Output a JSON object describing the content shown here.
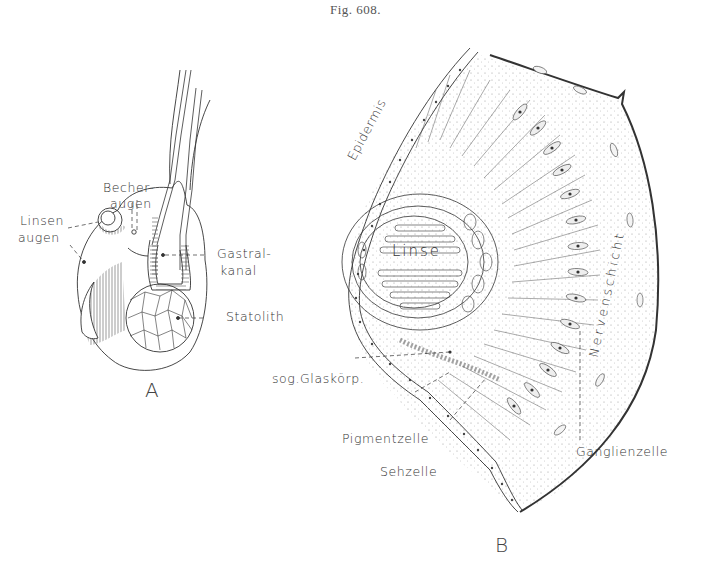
{
  "figure": {
    "caption": "Fig. 608.",
    "panels": [
      {
        "id": "A",
        "label": "A",
        "labels": {
          "becheraugen_1": "Becher-",
          "becheraugen_2": "augen",
          "linsenaugen_1": "Linsen",
          "linsenaugen_2": "augen",
          "gastralkanal_1": "Gastral-",
          "gastralkanal_2": "kanal",
          "statolith": "Statolith"
        }
      },
      {
        "id": "B",
        "label": "B",
        "labels": {
          "epidermis": "Epidermis",
          "linse": "Linse",
          "nervenschicht": "Nervenschicht",
          "glaskoerper": "sog.Glaskörp.",
          "pigmentzelle": "Pigmentzelle",
          "sehzelle": "Sehzelle",
          "ganglienzelle": "Ganglienzelle"
        }
      }
    ],
    "colors": {
      "ink": "#333333",
      "background": "#ffffff"
    }
  }
}
